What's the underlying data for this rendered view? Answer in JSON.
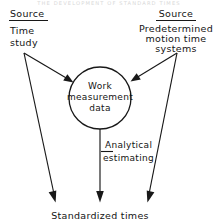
{
  "figure": {
    "page_header_ghost": "THE DEVELOPMENT OF STANDARD TIMES",
    "background_color": "#ffffff",
    "ink_color": "#181818"
  },
  "left_source": {
    "heading": "Source",
    "line1": "Time",
    "line2": "study"
  },
  "right_source": {
    "heading": "Source",
    "line1": "Predetermined",
    "line2": "motion time",
    "line3": "systems"
  },
  "center_node": {
    "line1": "Work",
    "line2": "measurement",
    "line3": "data",
    "shape": "circle",
    "center_x": 100,
    "center_y": 98,
    "radius": 31
  },
  "middle_edge": {
    "line1": "Analytical",
    "line2": "estimating"
  },
  "output_node": {
    "label": "Standardized times"
  },
  "arrows": [
    {
      "name": "time-study-to-node",
      "from": "Time study",
      "to": "Work measurement data"
    },
    {
      "name": "time-study-to-output",
      "from": "Time study",
      "to": "Standardized times"
    },
    {
      "name": "pmts-to-node",
      "from": "Predetermined motion time systems",
      "to": "Work measurement data"
    },
    {
      "name": "pmts-to-output",
      "from": "Predetermined motion time systems",
      "to": "Standardized times"
    },
    {
      "name": "node-to-output",
      "from": "Work measurement data",
      "to": "Standardized times",
      "edge_label": "Analytical estimating"
    }
  ]
}
